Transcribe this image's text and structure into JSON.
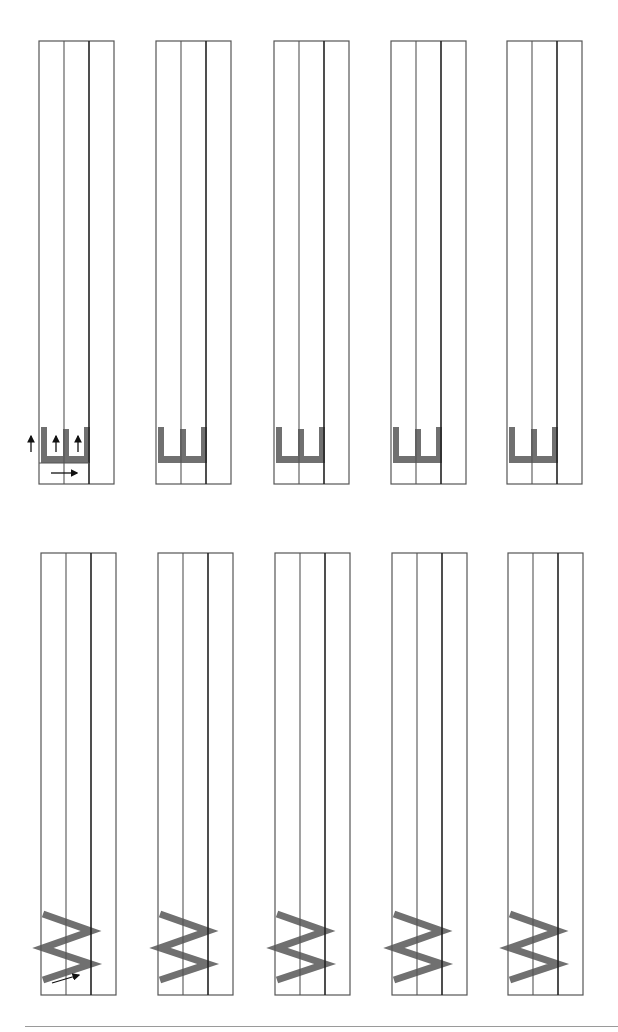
{
  "worksheet": {
    "title": "Letter tracing practice sheet (rotated)",
    "colors": {
      "guide_line": "#555555",
      "mid_line": "#222222",
      "letter_stroke": "#707070",
      "arrow": "#111111",
      "footer_line": "#9a9a9a"
    },
    "rows": [
      {
        "letter": "E",
        "box_top": 41,
        "box_bottom": 484,
        "columns": [
          {
            "x": 39,
            "has_arrows": true
          },
          {
            "x": 156,
            "has_arrows": false
          },
          {
            "x": 274,
            "has_arrows": false
          },
          {
            "x": 391,
            "has_arrows": false
          },
          {
            "x": 507,
            "has_arrows": false
          }
        ],
        "stroke_arrows": [
          "up",
          "up",
          "up",
          "right"
        ]
      },
      {
        "letter": "W",
        "box_top": 553,
        "box_bottom": 995,
        "columns": [
          {
            "x": 41,
            "has_arrows": true
          },
          {
            "x": 158,
            "has_arrows": false
          },
          {
            "x": 275,
            "has_arrows": false
          },
          {
            "x": 392,
            "has_arrows": false
          },
          {
            "x": 508,
            "has_arrows": false
          }
        ],
        "stroke_arrows": [
          "diagonal-up-right"
        ]
      }
    ],
    "lane_width": 25,
    "box_width": 75
  }
}
